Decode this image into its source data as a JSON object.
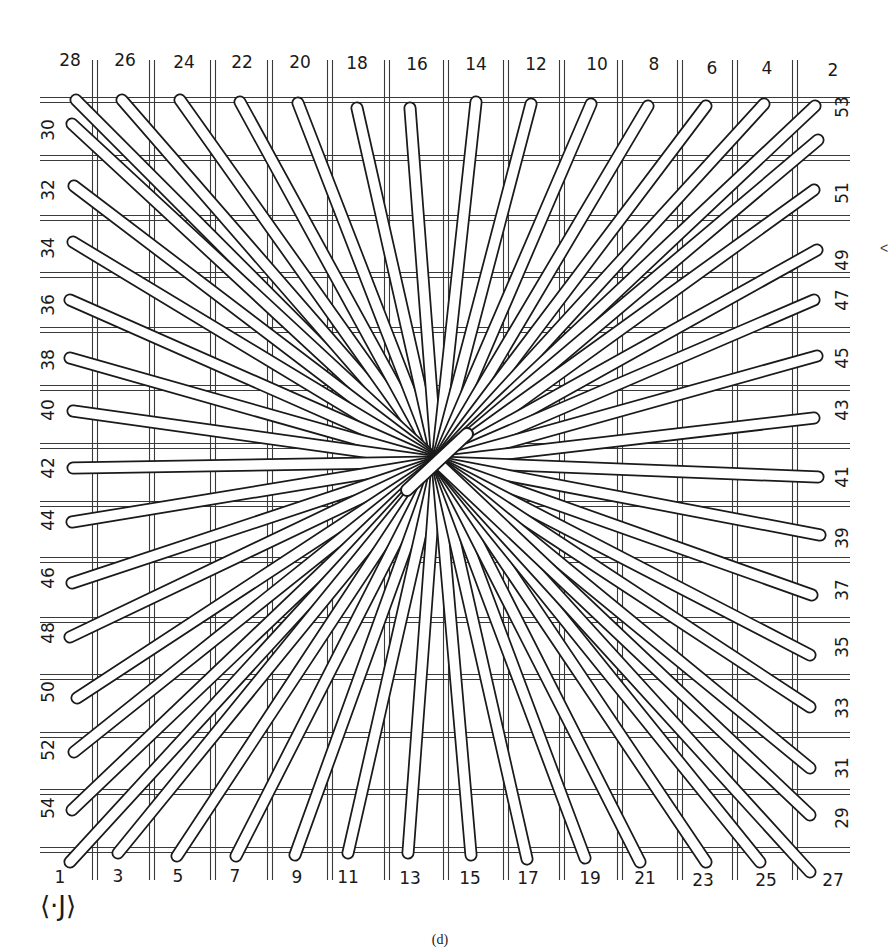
{
  "diagram": {
    "type": "radial-spoke-weaving-diagram",
    "caption": "(d)",
    "corner_mark": "⟨·J⟩",
    "edge_mark": "<",
    "center": [
      437,
      462
    ],
    "colors": {
      "ink": "#1a1a1a",
      "spoke_fill": "#ffffff",
      "grid": "#3a3a3a",
      "background": "#ffffff"
    },
    "grid": {
      "vertical_x": [
        95,
        152,
        213,
        270,
        330,
        387,
        446,
        506,
        562,
        620,
        680,
        735,
        795
      ],
      "horizontal_y": [
        100,
        158,
        218,
        275,
        330,
        388,
        446,
        504,
        560,
        620,
        677,
        735,
        792,
        850
      ],
      "x_range": [
        40,
        850
      ],
      "y_range": [
        60,
        880
      ]
    },
    "labels": {
      "top": [
        {
          "text": "28",
          "x": 70,
          "y": 60,
          "spoke_end": [
            76,
            100
          ]
        },
        {
          "text": "26",
          "x": 125,
          "y": 60,
          "spoke_end": [
            122,
            100
          ]
        },
        {
          "text": "24",
          "x": 184,
          "y": 62,
          "spoke_end": [
            180,
            100
          ]
        },
        {
          "text": "22",
          "x": 242,
          "y": 62,
          "spoke_end": [
            240,
            102
          ]
        },
        {
          "text": "20",
          "x": 300,
          "y": 62,
          "spoke_end": [
            298,
            103
          ]
        },
        {
          "text": "18",
          "x": 357,
          "y": 63,
          "spoke_end": [
            357,
            108
          ]
        },
        {
          "text": "16",
          "x": 417,
          "y": 64,
          "spoke_end": [
            410,
            108
          ]
        },
        {
          "text": "14",
          "x": 476,
          "y": 64,
          "spoke_end": [
            476,
            102
          ]
        },
        {
          "text": "12",
          "x": 536,
          "y": 64,
          "spoke_end": [
            531,
            104
          ]
        },
        {
          "text": "10",
          "x": 597,
          "y": 64,
          "spoke_end": [
            591,
            104
          ]
        },
        {
          "text": "8",
          "x": 654,
          "y": 64,
          "spoke_end": [
            648,
            106
          ]
        },
        {
          "text": "6",
          "x": 712,
          "y": 68,
          "spoke_end": [
            706,
            106
          ]
        },
        {
          "text": "4",
          "x": 767,
          "y": 68,
          "spoke_end": [
            764,
            104
          ]
        },
        {
          "text": "2",
          "x": 833,
          "y": 70,
          "spoke_end": [
            815,
            106
          ]
        }
      ],
      "left": [
        {
          "text": "30",
          "x": 48,
          "y": 130,
          "spoke_end": [
            72,
            124
          ]
        },
        {
          "text": "32",
          "x": 48,
          "y": 190,
          "spoke_end": [
            74,
            186
          ]
        },
        {
          "text": "34",
          "x": 48,
          "y": 248,
          "spoke_end": [
            73,
            242
          ]
        },
        {
          "text": "36",
          "x": 48,
          "y": 305,
          "spoke_end": [
            70,
            300
          ]
        },
        {
          "text": "38",
          "x": 48,
          "y": 360,
          "spoke_end": [
            70,
            358
          ]
        },
        {
          "text": "40",
          "x": 48,
          "y": 410,
          "spoke_end": [
            73,
            411
          ]
        },
        {
          "text": "42",
          "x": 48,
          "y": 468,
          "spoke_end": [
            73,
            468
          ]
        },
        {
          "text": "44",
          "x": 48,
          "y": 520,
          "spoke_end": [
            72,
            522
          ]
        },
        {
          "text": "46",
          "x": 48,
          "y": 578,
          "spoke_end": [
            72,
            583
          ]
        },
        {
          "text": "48",
          "x": 48,
          "y": 633,
          "spoke_end": [
            70,
            637
          ]
        },
        {
          "text": "50",
          "x": 48,
          "y": 692,
          "spoke_end": [
            77,
            698
          ]
        },
        {
          "text": "52",
          "x": 48,
          "y": 750,
          "spoke_end": [
            74,
            752
          ]
        },
        {
          "text": "54",
          "x": 48,
          "y": 808,
          "spoke_end": [
            72,
            810
          ]
        }
      ],
      "bottom": [
        {
          "text": "1",
          "x": 60,
          "y": 877,
          "spoke_end": [
            70,
            862
          ]
        },
        {
          "text": "3",
          "x": 118,
          "y": 876,
          "spoke_end": [
            118,
            853
          ]
        },
        {
          "text": "5",
          "x": 178,
          "y": 876,
          "spoke_end": [
            177,
            856
          ]
        },
        {
          "text": "7",
          "x": 235,
          "y": 876,
          "spoke_end": [
            236,
            856
          ]
        },
        {
          "text": "9",
          "x": 297,
          "y": 877,
          "spoke_end": [
            295,
            855
          ]
        },
        {
          "text": "11",
          "x": 348,
          "y": 877,
          "spoke_end": [
            348,
            853
          ]
        },
        {
          "text": "13",
          "x": 410,
          "y": 878,
          "spoke_end": [
            408,
            853
          ]
        },
        {
          "text": "15",
          "x": 470,
          "y": 878,
          "spoke_end": [
            471,
            855
          ]
        },
        {
          "text": "17",
          "x": 528,
          "y": 878,
          "spoke_end": [
            527,
            859
          ]
        },
        {
          "text": "19",
          "x": 590,
          "y": 878,
          "spoke_end": [
            585,
            858
          ]
        },
        {
          "text": "21",
          "x": 645,
          "y": 878,
          "spoke_end": [
            640,
            862
          ]
        },
        {
          "text": "23",
          "x": 703,
          "y": 880,
          "spoke_end": [
            706,
            862
          ]
        },
        {
          "text": "25",
          "x": 766,
          "y": 880,
          "spoke_end": [
            760,
            862
          ]
        },
        {
          "text": "27",
          "x": 833,
          "y": 880,
          "spoke_end": [
            810,
            872
          ]
        }
      ],
      "right": [
        {
          "text": "53",
          "x": 842,
          "y": 107,
          "spoke_end": [
            818,
            140
          ]
        },
        {
          "text": "51",
          "x": 842,
          "y": 193,
          "spoke_end": [
            814,
            190
          ]
        },
        {
          "text": "49",
          "x": 842,
          "y": 260,
          "spoke_end": [
            817,
            250
          ]
        },
        {
          "text": "47",
          "x": 842,
          "y": 300,
          "spoke_end": [
            814,
            300
          ]
        },
        {
          "text": "45",
          "x": 842,
          "y": 358,
          "spoke_end": [
            817,
            356
          ]
        },
        {
          "text": "43",
          "x": 842,
          "y": 410,
          "spoke_end": [
            814,
            418
          ]
        },
        {
          "text": "41",
          "x": 842,
          "y": 477,
          "spoke_end": [
            818,
            477
          ]
        },
        {
          "text": "39",
          "x": 842,
          "y": 538,
          "spoke_end": [
            820,
            535
          ]
        },
        {
          "text": "37",
          "x": 842,
          "y": 590,
          "spoke_end": [
            812,
            595
          ]
        },
        {
          "text": "35",
          "x": 842,
          "y": 647,
          "spoke_end": [
            810,
            655
          ]
        },
        {
          "text": "33",
          "x": 842,
          "y": 708,
          "spoke_end": [
            810,
            707
          ]
        },
        {
          "text": "31",
          "x": 842,
          "y": 768,
          "spoke_end": [
            810,
            768
          ]
        },
        {
          "text": "29",
          "x": 842,
          "y": 818,
          "spoke_end": [
            810,
            815
          ]
        }
      ]
    }
  }
}
